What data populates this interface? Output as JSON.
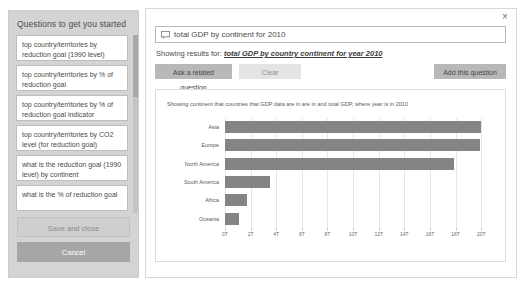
{
  "sidebar": {
    "title": "Questions to get you started",
    "items": [
      {
        "label": "top country/territories by reduction goal (1990 level)"
      },
      {
        "label": "top country/territories by % of reduction goal"
      },
      {
        "label": "top country/territories by % of reduction goal indicator"
      },
      {
        "label": "top country/territories by CO2 level (for reduction goal)"
      },
      {
        "label": "what is the reduction goal (1990 level) by continent"
      },
      {
        "label": "what is the % of reduction goal"
      }
    ],
    "save_label": "Save and close",
    "cancel_label": "Cancel"
  },
  "main": {
    "close_label": "×",
    "search": {
      "icon": "speech-bubble-icon",
      "value": "total GDP by continent for 2010",
      "placeholder": "Ask a question about your data"
    },
    "results_prefix": "Showing results for:",
    "results_link": "total GDP by country continent for year 2010",
    "buttons": {
      "ask_related": "Ask a related question",
      "clear": "Clear",
      "add_question": "Add this question"
    }
  },
  "chart_data": {
    "type": "bar",
    "orientation": "horizontal",
    "title": "",
    "subtitle": "Showing continent that countries that GDP data are in are in and total GDP, where year is in 2010",
    "categories": [
      "Asia",
      "Europe",
      "North America",
      "South America",
      "Africa",
      "Oceania"
    ],
    "values": [
      20.0,
      19.9,
      17.9,
      3.5,
      1.7,
      1.1
    ],
    "value_unit": "T",
    "xlabel": "",
    "ylabel": "",
    "xlim": [
      0,
      21
    ],
    "ticks": [
      0,
      2,
      4,
      6,
      8,
      10,
      12,
      14,
      16,
      18,
      20
    ],
    "tick_labels": [
      "0T",
      "2T",
      "4T",
      "6T",
      "8T",
      "10T",
      "12T",
      "14T",
      "16T",
      "18T",
      "20T"
    ],
    "grid": true,
    "legend": "none",
    "bar_color": "#848484"
  },
  "colors": {
    "sidebar_bg": "#d4d4d4",
    "cancel_bg": "#a6a6a6",
    "button_bg": "#b8b8b8",
    "bar": "#848484"
  }
}
